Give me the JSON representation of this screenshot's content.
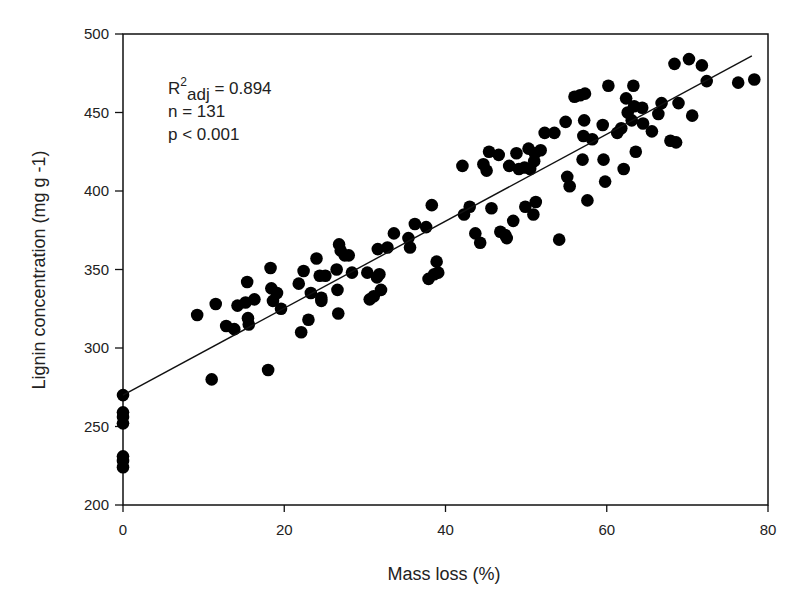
{
  "chart_data": {
    "type": "scatter",
    "title": "",
    "xlabel": "Mass loss (%)",
    "ylabel": "Lignin concentration (mg g -1)",
    "xlim": [
      0,
      80
    ],
    "ylim": [
      200,
      500
    ],
    "xticks": [
      0,
      20,
      40,
      60,
      80
    ],
    "yticks": [
      200,
      250,
      300,
      350,
      400,
      450,
      500
    ],
    "grid": false,
    "annotations": {
      "r2_label": "R",
      "r2_sup": "2",
      "r2_sub": "adj",
      "r2_value": " = 0.894",
      "n": "n = 131",
      "p": "p < 0.001"
    },
    "fit_line": {
      "x": [
        0,
        78
      ],
      "y": [
        270,
        486
      ]
    },
    "marker_color": "#000000",
    "points": [
      [
        0,
        270
      ],
      [
        0,
        259
      ],
      [
        0,
        256
      ],
      [
        0,
        252
      ],
      [
        0,
        231
      ],
      [
        0,
        228
      ],
      [
        0,
        224
      ],
      [
        9.2,
        321
      ],
      [
        11,
        280
      ],
      [
        11.5,
        328
      ],
      [
        12.8,
        314
      ],
      [
        13.8,
        312
      ],
      [
        14.2,
        327
      ],
      [
        15.2,
        329
      ],
      [
        15.4,
        342
      ],
      [
        15.5,
        319
      ],
      [
        15.6,
        315
      ],
      [
        16.3,
        331
      ],
      [
        18,
        286
      ],
      [
        18.3,
        351
      ],
      [
        18.4,
        338
      ],
      [
        18.6,
        330
      ],
      [
        19.1,
        335
      ],
      [
        19.6,
        325
      ],
      [
        21.8,
        341
      ],
      [
        22.1,
        310
      ],
      [
        22.4,
        349
      ],
      [
        23,
        318
      ],
      [
        23.3,
        335
      ],
      [
        24,
        357
      ],
      [
        24.4,
        346
      ],
      [
        24.6,
        332
      ],
      [
        24.6,
        330
      ],
      [
        25.1,
        346
      ],
      [
        26.5,
        350
      ],
      [
        26.6,
        337
      ],
      [
        26.7,
        322
      ],
      [
        26.8,
        366
      ],
      [
        27,
        362
      ],
      [
        27.5,
        359
      ],
      [
        28,
        359
      ],
      [
        28.4,
        348
      ],
      [
        30.3,
        348
      ],
      [
        30.6,
        331
      ],
      [
        31.1,
        333
      ],
      [
        31.5,
        345
      ],
      [
        31.6,
        363
      ],
      [
        31.8,
        347
      ],
      [
        32,
        337
      ],
      [
        32.8,
        364
      ],
      [
        33.6,
        373
      ],
      [
        35.4,
        370
      ],
      [
        35.6,
        364
      ],
      [
        36.2,
        379
      ],
      [
        37.6,
        377
      ],
      [
        37.9,
        344
      ],
      [
        38.3,
        391
      ],
      [
        38.6,
        347
      ],
      [
        38.9,
        355
      ],
      [
        39.1,
        348
      ],
      [
        42.1,
        416
      ],
      [
        42.3,
        385
      ],
      [
        43,
        390
      ],
      [
        43.7,
        373
      ],
      [
        44.3,
        367
      ],
      [
        44.7,
        417
      ],
      [
        45.1,
        413
      ],
      [
        45.4,
        425
      ],
      [
        45.7,
        389
      ],
      [
        46.6,
        423
      ],
      [
        46.8,
        374
      ],
      [
        47.4,
        372
      ],
      [
        47.6,
        370
      ],
      [
        47.9,
        416
      ],
      [
        48.4,
        381
      ],
      [
        48.8,
        424
      ],
      [
        49.1,
        414
      ],
      [
        49.8,
        415
      ],
      [
        49.9,
        390
      ],
      [
        50.3,
        427
      ],
      [
        50.5,
        414
      ],
      [
        50.9,
        385
      ],
      [
        51,
        419
      ],
      [
        51.1,
        424
      ],
      [
        51.2,
        393
      ],
      [
        51.8,
        426
      ],
      [
        52.3,
        437
      ],
      [
        53.5,
        437
      ],
      [
        54.1,
        369
      ],
      [
        54.9,
        444
      ],
      [
        55.1,
        409
      ],
      [
        55.4,
        403
      ],
      [
        56,
        460
      ],
      [
        56.7,
        461
      ],
      [
        57,
        420
      ],
      [
        57.1,
        435
      ],
      [
        57.2,
        445
      ],
      [
        57.3,
        462
      ],
      [
        57.6,
        394
      ],
      [
        58.2,
        433
      ],
      [
        59.5,
        442
      ],
      [
        59.6,
        420
      ],
      [
        59.8,
        406
      ],
      [
        60.2,
        467
      ],
      [
        61.3,
        437
      ],
      [
        61.8,
        440
      ],
      [
        62.1,
        414
      ],
      [
        62.4,
        459
      ],
      [
        62.6,
        450
      ],
      [
        63.1,
        445
      ],
      [
        63.3,
        467
      ],
      [
        63.4,
        454
      ],
      [
        63.6,
        425
      ],
      [
        64.4,
        453
      ],
      [
        64.5,
        443
      ],
      [
        65.6,
        438
      ],
      [
        66.4,
        449
      ],
      [
        66.8,
        456
      ],
      [
        67.9,
        432
      ],
      [
        68.4,
        481
      ],
      [
        68.6,
        431
      ],
      [
        68.9,
        456
      ],
      [
        70.2,
        484
      ],
      [
        70.6,
        448
      ],
      [
        71.8,
        480
      ],
      [
        72.4,
        470
      ],
      [
        76.3,
        469
      ],
      [
        78.3,
        471
      ]
    ]
  }
}
